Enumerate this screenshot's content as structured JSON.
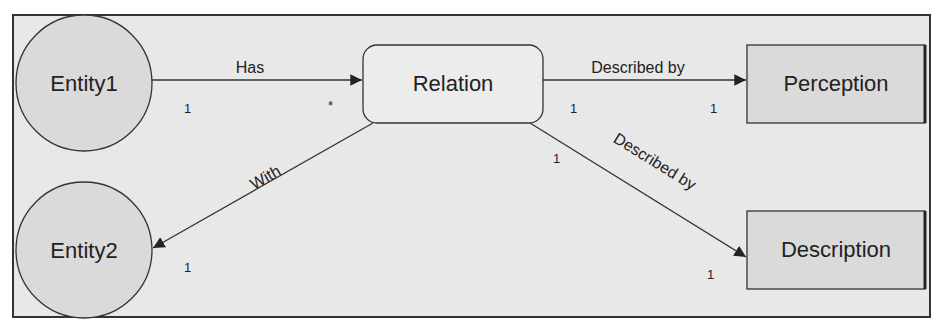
{
  "diagram": {
    "type": "entity-relationship",
    "colors": {
      "background": "#e8e8e8",
      "frame_border": "#333333",
      "node_fill": "#dadada",
      "relation_fill": "#ececec",
      "line": "#333333",
      "text": "#222222"
    },
    "nodes": {
      "entity1": {
        "label": "Entity1",
        "shape": "circle"
      },
      "entity2": {
        "label": "Entity2",
        "shape": "circle"
      },
      "relation": {
        "label": "Relation",
        "shape": "rounded-rect"
      },
      "perception": {
        "label": "Perception",
        "shape": "rect"
      },
      "description": {
        "label": "Description",
        "shape": "rect"
      }
    },
    "edges": {
      "has": {
        "label": "Has",
        "from": "Entity1",
        "to": "Relation",
        "source_mult": "1",
        "target_mult": "*"
      },
      "with": {
        "label": "With",
        "from": "Relation",
        "to": "Entity2",
        "target_mult": "1"
      },
      "described_by_perception": {
        "label": "Described by",
        "from": "Relation",
        "to": "Perception",
        "source_mult": "1",
        "target_mult": "1"
      },
      "described_by_description": {
        "label": "Described by",
        "from": "Relation",
        "to": "Description",
        "source_mult": "1",
        "target_mult": "1"
      }
    }
  }
}
